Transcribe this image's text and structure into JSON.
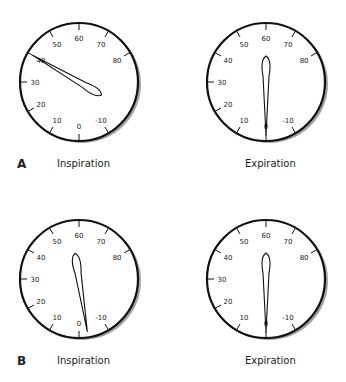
{
  "figure": {
    "scale_labels": [
      "0",
      "10",
      "20",
      "30",
      "40",
      "50",
      "60",
      "70",
      "80",
      "-10"
    ],
    "scale_values": [
      0,
      10,
      20,
      30,
      40,
      50,
      60,
      70,
      80,
      -10
    ],
    "panels": [
      {
        "letter": "A",
        "gauges": [
          {
            "caption": "Inspiration",
            "needle_value": 40
          },
          {
            "caption": "Expiration",
            "needle_value": 0
          }
        ]
      },
      {
        "letter": "B",
        "gauges": [
          {
            "caption": "Inspiration",
            "needle_value": -3
          },
          {
            "caption": "Expiration",
            "needle_value": 0
          }
        ]
      }
    ]
  },
  "colors": {
    "stroke": "#111111",
    "shadow": "#555555",
    "face": "#ffffff"
  }
}
